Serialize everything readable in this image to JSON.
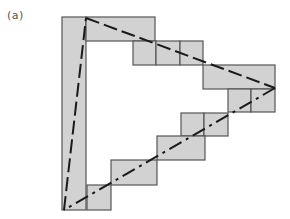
{
  "figure": {
    "label": "(a)",
    "fill_color": "#d2d2d2",
    "stroke_color": "#555555",
    "line_color": "#1a1a1a"
  },
  "cells": [
    {
      "x": 62,
      "y": 17,
      "w": 24,
      "h": 193
    },
    {
      "x": 86,
      "y": 17,
      "w": 69,
      "h": 24
    },
    {
      "x": 133,
      "y": 41,
      "w": 23,
      "h": 24
    },
    {
      "x": 156,
      "y": 41,
      "w": 24,
      "h": 24
    },
    {
      "x": 180,
      "y": 41,
      "w": 23,
      "h": 24
    },
    {
      "x": 203,
      "y": 65,
      "w": 72,
      "h": 24
    },
    {
      "x": 228,
      "y": 89,
      "w": 23,
      "h": 23
    },
    {
      "x": 251,
      "y": 89,
      "w": 24,
      "h": 23
    },
    {
      "x": 181,
      "y": 113,
      "w": 23,
      "h": 23
    },
    {
      "x": 204,
      "y": 113,
      "w": 24,
      "h": 23
    },
    {
      "x": 157,
      "y": 136,
      "w": 48,
      "h": 24
    },
    {
      "x": 111,
      "y": 160,
      "w": 46,
      "h": 25
    },
    {
      "x": 87,
      "y": 185,
      "w": 24,
      "h": 25
    }
  ],
  "triangle": {
    "vertices": [
      [
        86,
        18
      ],
      [
        275,
        88
      ],
      [
        64,
        210
      ]
    ]
  }
}
